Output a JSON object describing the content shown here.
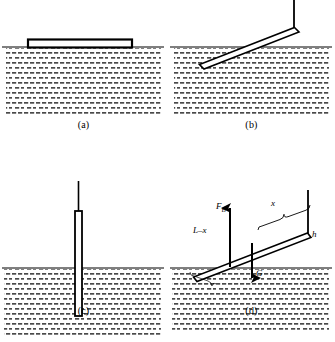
{
  "figure": {
    "panels": [
      {
        "id": "a",
        "caption": "(a)",
        "state": "rod floating horizontally on water surface"
      },
      {
        "id": "b",
        "caption": "(b)",
        "state": "rod tilted, partially submerged, supported at upper right"
      },
      {
        "id": "c",
        "caption": "(c)",
        "state": "rod vertical, partially submerged"
      },
      {
        "id": "d",
        "caption": "(d)",
        "state": "tilted rod free-body diagram with buoyancy and weight"
      }
    ]
  },
  "labels": {
    "buoyant_force": "F",
    "buoyant_force_sub": "B",
    "submerged_length": "L–x",
    "emerged_length": "x",
    "height": "h",
    "weight": "G"
  },
  "colors": {
    "ink": "#000000",
    "water_dash": "#4a4a4a",
    "background": "#ffffff"
  }
}
